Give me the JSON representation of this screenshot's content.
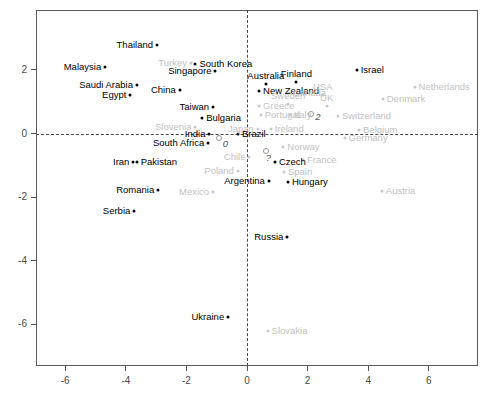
{
  "chart_data": {
    "type": "scatter",
    "title": "",
    "xlabel": "",
    "ylabel": "",
    "xlim": [
      -7.3,
      7.6
    ],
    "ylim": [
      -7.1,
      3.7
    ],
    "grid": false,
    "legend": "none",
    "reference_lines": {
      "x": 0,
      "y": 0,
      "style": "dashed"
    },
    "xticks": [
      -6,
      -4,
      -2,
      0,
      2,
      4,
      6
    ],
    "yticks": [
      2,
      0,
      -2,
      -4,
      -6
    ],
    "points": [
      {
        "label": "Thailand",
        "x": -2.97,
        "y": 2.78,
        "color": "dark",
        "anchor": "right"
      },
      {
        "label": "Malaysia",
        "x": -4.68,
        "y": 2.08,
        "color": "dark",
        "anchor": "right"
      },
      {
        "label": "Turkey",
        "x": -1.85,
        "y": 2.22,
        "color": "gray",
        "anchor": "right"
      },
      {
        "label": "South Korea",
        "x": -1.7,
        "y": 2.18,
        "color": "dark",
        "anchor": "left"
      },
      {
        "label": "Singapore",
        "x": -1.04,
        "y": 1.95,
        "color": "dark",
        "anchor": "right"
      },
      {
        "label": "Israel",
        "x": 3.62,
        "y": 2.0,
        "color": "dark",
        "anchor": "left"
      },
      {
        "label": "Netherlands",
        "x": 5.53,
        "y": 1.46,
        "color": "gray",
        "anchor": "left"
      },
      {
        "label": "Saudi Arabia",
        "x": -3.63,
        "y": 1.52,
        "color": "dark",
        "anchor": "right"
      },
      {
        "label": "China",
        "x": -2.22,
        "y": 1.36,
        "color": "dark",
        "anchor": "right"
      },
      {
        "label": "Egypt",
        "x": -3.85,
        "y": 1.22,
        "color": "dark",
        "anchor": "right"
      },
      {
        "label": "Australia",
        "x": 0.62,
        "y": 1.56,
        "color": "dark",
        "anchor": "up"
      },
      {
        "label": "Finland",
        "x": 1.63,
        "y": 1.63,
        "color": "dark",
        "anchor": "up"
      },
      {
        "label": "New Zealand",
        "x": 0.4,
        "y": 1.33,
        "color": "dark",
        "anchor": "left"
      },
      {
        "label": "Canada",
        "x": 1.38,
        "y": 1.26,
        "color": "gray",
        "anchor": "left"
      },
      {
        "label": "USA",
        "x": 2.5,
        "y": 1.22,
        "color": "gray",
        "anchor": "up"
      },
      {
        "label": "Denmark",
        "x": 4.48,
        "y": 1.07,
        "color": "gray",
        "anchor": "left"
      },
      {
        "label": "Taiwan",
        "x": -1.12,
        "y": 0.83,
        "color": "dark",
        "anchor": "right"
      },
      {
        "label": "Greece",
        "x": 0.4,
        "y": 0.87,
        "color": "gray",
        "anchor": "left"
      },
      {
        "label": "Sweden",
        "x": 1.36,
        "y": 0.92,
        "color": "gray",
        "anchor": "up"
      },
      {
        "label": "UK",
        "x": 2.63,
        "y": 0.88,
        "color": "gray",
        "anchor": "up"
      },
      {
        "label": "Bulgaria",
        "x": -1.48,
        "y": 0.5,
        "color": "dark",
        "anchor": "left"
      },
      {
        "label": "Portugal",
        "x": 0.45,
        "y": 0.57,
        "color": "gray",
        "anchor": "left"
      },
      {
        "label": "Italy",
        "x": 1.42,
        "y": 0.57,
        "color": "gray",
        "anchor": "left"
      },
      {
        "label": "Switzerland",
        "x": 3.0,
        "y": 0.54,
        "color": "gray",
        "anchor": "left"
      },
      {
        "label": "Slovenia",
        "x": -1.7,
        "y": 0.22,
        "color": "gray",
        "anchor": "right"
      },
      {
        "label": "Japan",
        "x": 0.36,
        "y": 0.13,
        "color": "gray",
        "anchor": "right"
      },
      {
        "label": "Ireland",
        "x": 0.78,
        "y": 0.13,
        "color": "gray",
        "anchor": "left"
      },
      {
        "label": "Belgium",
        "x": 3.7,
        "y": 0.12,
        "color": "gray",
        "anchor": "left"
      },
      {
        "label": "India",
        "x": -1.24,
        "y": -0.02,
        "color": "dark",
        "anchor": "right"
      },
      {
        "label": "Brazil",
        "x": -0.3,
        "y": 0.0,
        "color": "dark",
        "anchor": "left"
      },
      {
        "label": "South Africa",
        "x": -1.28,
        "y": -0.3,
        "color": "dark",
        "anchor": "right"
      },
      {
        "label": "Germany",
        "x": 3.22,
        "y": -0.14,
        "color": "gray",
        "anchor": "left"
      },
      {
        "label": "Norway",
        "x": 1.2,
        "y": -0.42,
        "color": "gray",
        "anchor": "left"
      },
      {
        "label": "Chile",
        "x": 0.08,
        "y": -0.73,
        "color": "gray",
        "anchor": "right"
      },
      {
        "label": "Iran",
        "x": -3.75,
        "y": -0.91,
        "color": "dark",
        "anchor": "right"
      },
      {
        "label": "Pakistan",
        "x": -3.64,
        "y": -0.91,
        "color": "dark",
        "anchor": "left"
      },
      {
        "label": "Czech",
        "x": 0.92,
        "y": -0.9,
        "color": "dark",
        "anchor": "left"
      },
      {
        "label": "France",
        "x": 1.85,
        "y": -0.83,
        "color": "gray",
        "anchor": "left"
      },
      {
        "label": "Poland",
        "x": -0.3,
        "y": -1.17,
        "color": "gray",
        "anchor": "right"
      },
      {
        "label": "Spain",
        "x": 1.22,
        "y": -1.22,
        "color": "gray",
        "anchor": "left"
      },
      {
        "label": "Argentina",
        "x": 0.72,
        "y": -1.5,
        "color": "dark",
        "anchor": "right"
      },
      {
        "label": "Hungary",
        "x": 1.35,
        "y": -1.52,
        "color": "dark",
        "anchor": "left"
      },
      {
        "label": "Romania",
        "x": -2.93,
        "y": -1.78,
        "color": "dark",
        "anchor": "right"
      },
      {
        "label": "Mexico",
        "x": -1.12,
        "y": -1.84,
        "color": "gray",
        "anchor": "right"
      },
      {
        "label": "Austria",
        "x": 4.45,
        "y": -1.8,
        "color": "gray",
        "anchor": "left"
      },
      {
        "label": "Serbia",
        "x": -3.72,
        "y": -2.45,
        "color": "dark",
        "anchor": "right"
      },
      {
        "label": "Russia",
        "x": 1.33,
        "y": -3.25,
        "color": "dark",
        "anchor": "right"
      },
      {
        "label": "Ukraine",
        "x": -0.62,
        "y": -5.78,
        "color": "dark",
        "anchor": "right"
      },
      {
        "label": "Slovakia",
        "x": 0.68,
        "y": -6.22,
        "color": "gray",
        "anchor": "left"
      }
    ],
    "unlabeled_points": [
      {
        "x": -0.92,
        "y": -0.14,
        "note": "0"
      },
      {
        "x": 2.1,
        "y": 0.6,
        "note": "2"
      },
      {
        "x": 0.62,
        "y": -0.54,
        "note": "?"
      }
    ],
    "annotations": [
      {
        "text": "0",
        "x": -0.8,
        "y": -0.33
      },
      {
        "text": "2",
        "x": 2.25,
        "y": 0.52
      },
      {
        "text": "?",
        "x": 0.62,
        "y": -0.78
      }
    ]
  },
  "axes": {
    "x_tick_labels": [
      "-6",
      "-4",
      "-2",
      "0",
      "2",
      "4",
      "6"
    ],
    "y_tick_labels": [
      "2",
      "0",
      "-2",
      "-4",
      "-6"
    ]
  },
  "colors": {
    "dark_point": "#000000",
    "gray_point": "#c8c8c8",
    "frame": "#5a5a5a",
    "dashed_line": "#4a4a4a",
    "background": "#ffffff"
  }
}
